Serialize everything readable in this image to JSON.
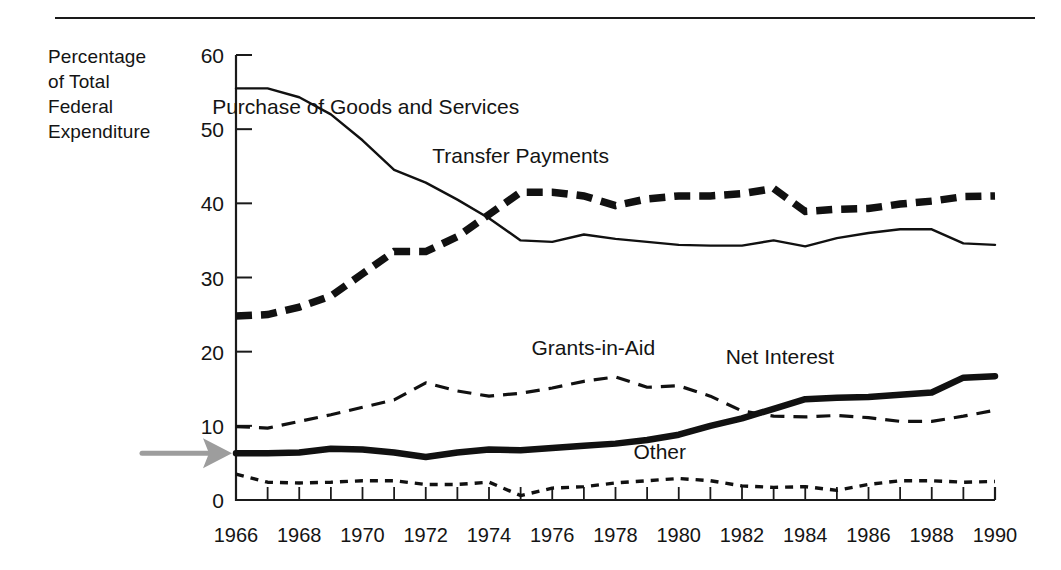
{
  "figure": {
    "y_axis_caption_lines": [
      "Percentage",
      "of Total",
      "Federal",
      "Expenditure"
    ],
    "divider_name": "top-horizontal-rule",
    "annotation": {
      "pointer_label": "gray-arrow-pointing-to-net-interest-1966"
    }
  },
  "chart_data": {
    "type": "line",
    "title": "",
    "subtitle": "",
    "xlabel": "",
    "ylabel": "Percentage of Total Federal Expenditure",
    "xlim": [
      1966,
      1990
    ],
    "ylim": [
      0,
      60
    ],
    "grid": false,
    "legend": "inline-labels",
    "x": [
      1966,
      1967,
      1968,
      1969,
      1970,
      1971,
      1972,
      1973,
      1974,
      1975,
      1976,
      1977,
      1978,
      1979,
      1980,
      1981,
      1982,
      1983,
      1984,
      1985,
      1986,
      1987,
      1988,
      1989,
      1990
    ],
    "xticks": [
      1966,
      1968,
      1970,
      1972,
      1974,
      1976,
      1978,
      1980,
      1982,
      1984,
      1986,
      1988,
      1990
    ],
    "xtick_labels": [
      "1966",
      "1968",
      "1970",
      "1972",
      "1974",
      "1976",
      "1978",
      "1980",
      "1982",
      "1984",
      "1986",
      "1988",
      "1990"
    ],
    "yticks": [
      0,
      10,
      20,
      30,
      40,
      50,
      60
    ],
    "ytick_labels": [
      "0",
      "10",
      "20",
      "30",
      "40",
      "50",
      "60"
    ],
    "series": [
      {
        "name": "Purchase of Goods and Services",
        "label": "Purchase of Goods and Services",
        "style": "solid-thin",
        "label_xy": [
          1970.1,
          52.0
        ],
        "values": [
          55.5,
          55.5,
          54.3,
          52.0,
          48.5,
          44.5,
          42.8,
          40.5,
          38.0,
          35.0,
          34.8,
          35.8,
          35.2,
          34.8,
          34.4,
          34.3,
          34.3,
          35.0,
          34.2,
          35.3,
          36.0,
          36.5,
          36.5,
          34.6,
          34.4
        ]
      },
      {
        "name": "Transfer Payments",
        "label": "Transfer Payments",
        "style": "dashed-heavy",
        "label_xy": [
          1975.0,
          45.4
        ],
        "values": [
          24.8,
          25.0,
          26.0,
          27.5,
          30.5,
          33.5,
          33.5,
          35.5,
          38.5,
          41.5,
          41.5,
          41.0,
          39.7,
          40.6,
          41.0,
          41.0,
          41.3,
          42.0,
          38.9,
          39.2,
          39.3,
          39.9,
          40.3,
          40.9,
          41.0
        ]
      },
      {
        "name": "Grants-in-Aid",
        "label": "Grants-in-Aid",
        "style": "dashed-light",
        "label_xy": [
          1977.3,
          19.5
        ],
        "values": [
          9.9,
          9.7,
          10.6,
          11.5,
          12.5,
          13.5,
          15.8,
          14.7,
          14.0,
          14.4,
          15.1,
          16.0,
          16.6,
          15.2,
          15.4,
          14.0,
          12.0,
          11.3,
          11.2,
          11.4,
          11.1,
          10.6,
          10.6,
          11.3,
          12.1
        ]
      },
      {
        "name": "Net Interest",
        "label": "Net Interest",
        "style": "solid-heavy",
        "label_xy": [
          1983.2,
          18.3
        ],
        "values": [
          6.3,
          6.3,
          6.4,
          6.9,
          6.8,
          6.4,
          5.8,
          6.4,
          6.8,
          6.7,
          7.0,
          7.3,
          7.6,
          8.1,
          8.8,
          10.0,
          11.0,
          12.3,
          13.6,
          13.8,
          13.9,
          14.2,
          14.5,
          16.5,
          16.7
        ]
      },
      {
        "name": "Other",
        "label": "Other",
        "style": "dotted",
        "label_xy": [
          1979.4,
          5.5
        ],
        "values": [
          3.5,
          2.4,
          2.3,
          2.4,
          2.6,
          2.6,
          2.1,
          2.1,
          2.4,
          0.6,
          1.6,
          1.8,
          2.3,
          2.6,
          2.9,
          2.6,
          1.9,
          1.7,
          1.8,
          1.3,
          2.1,
          2.6,
          2.6,
          2.4,
          2.5
        ]
      }
    ]
  }
}
